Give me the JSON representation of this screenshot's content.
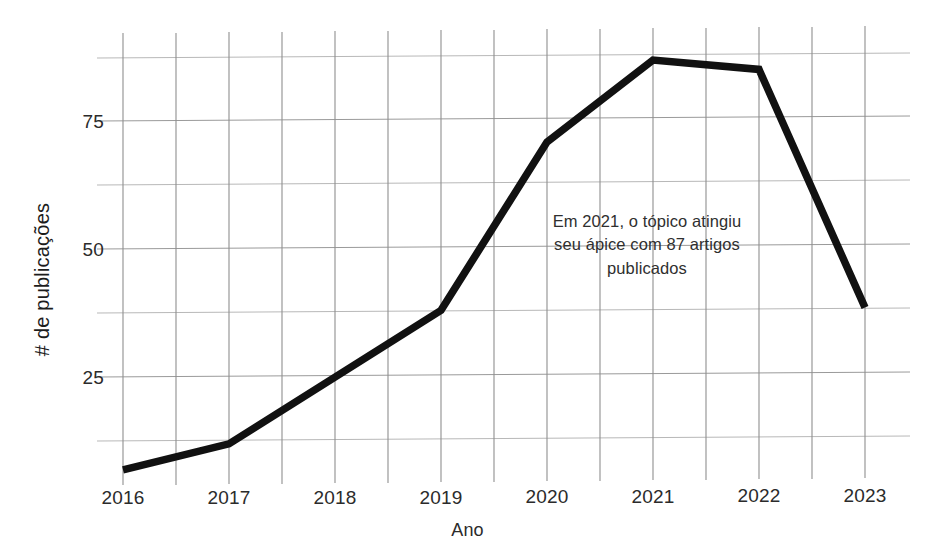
{
  "chart_data": {
    "type": "line",
    "title": "",
    "xlabel": "Ano",
    "ylabel": "# de publicações",
    "categories": [
      "2016",
      "2017",
      "2018",
      "2019",
      "2020",
      "2021",
      "2022",
      "2023"
    ],
    "x": [
      2016,
      2017,
      2018,
      2019,
      2020,
      2021,
      2022,
      2023
    ],
    "values": [
      7,
      12,
      25,
      38,
      71,
      87,
      85,
      38
    ],
    "series": [
      {
        "name": "# de publicações",
        "values": [
          7,
          12,
          25,
          38,
          71,
          87,
          85,
          38
        ]
      }
    ],
    "ylim": [
      0,
      93
    ],
    "xlim": [
      2016,
      2023
    ],
    "y_tick_labels": [
      "25",
      "50",
      "75"
    ],
    "y_tick_values": [
      25,
      50,
      75
    ],
    "y_gridline_values": [
      12.5,
      25,
      37.5,
      50,
      62.5,
      75,
      87.5
    ],
    "x_tick_labels": [
      "2016",
      "2017",
      "2018",
      "2019",
      "2020",
      "2021",
      "2022",
      "2023"
    ],
    "grid": true,
    "legend": false,
    "line_color": "#111111",
    "grid_color": "#9a9a9a",
    "text_color": "#2b2b2b",
    "background_color": "#ffffff",
    "annotations": [
      {
        "id": "peak-2021",
        "lines": [
          "Em 2021, o tópico atingiu",
          "seu ápice com 87 artigos",
          "publicados"
        ],
        "full_text": "Em 2021, o tópico atingiu seu ápice com 87 artigos publicados"
      }
    ]
  },
  "axes": {
    "y_ticks": [
      {
        "label": "75",
        "value": 75
      },
      {
        "label": "50",
        "value": 50
      },
      {
        "label": "25",
        "value": 25
      }
    ],
    "x_ticks": [
      {
        "label": "2016",
        "value": 2016
      },
      {
        "label": "2017",
        "value": 2017
      },
      {
        "label": "2018",
        "value": 2018
      },
      {
        "label": "2019",
        "value": 2019
      },
      {
        "label": "2020",
        "value": 2020
      },
      {
        "label": "2021",
        "value": 2021
      },
      {
        "label": "2022",
        "value": 2022
      },
      {
        "label": "2023",
        "value": 2023
      }
    ],
    "x_title": "Ano",
    "y_title": "# de publicações"
  },
  "annotation": {
    "line1": "Em 2021, o tópico atingiu",
    "line2": "seu ápice com 87 artigos",
    "line3": "publicados"
  }
}
